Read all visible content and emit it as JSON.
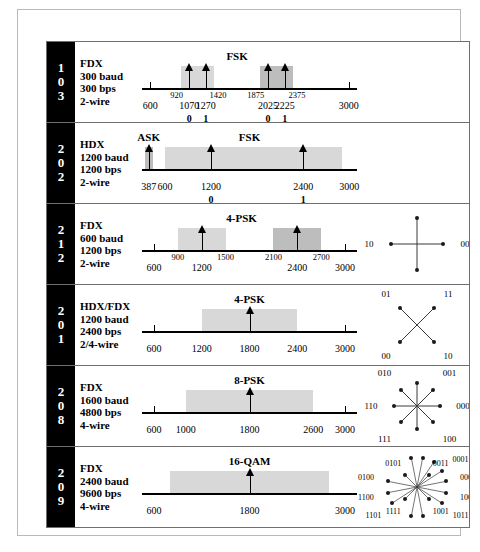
{
  "chart_data": {
    "type": "table",
    "columns": [
      "standard",
      "specs",
      "modulation",
      "spectrum",
      "constellation"
    ],
    "rows": [
      {
        "standard": "103",
        "standard_digits": [
          "1",
          "0",
          "3"
        ],
        "specs": [
          "FDX",
          "300 baud",
          "300 bps",
          "2-wire"
        ],
        "modulation": "FSK",
        "modulation_center_hz": 1650,
        "axis": {
          "min_hz": 500,
          "max_hz": 3100
        },
        "bands": [
          {
            "start_hz": 970,
            "end_hz": 1370,
            "shade": "light"
          },
          {
            "start_hz": 1925,
            "end_hz": 2325,
            "shade": "dark"
          }
        ],
        "carriers": [
          {
            "hz": 1070,
            "bit": "0"
          },
          {
            "hz": 1270,
            "bit": "1"
          },
          {
            "hz": 2025,
            "bit": "0"
          },
          {
            "hz": 2225,
            "bit": "1"
          }
        ],
        "edge_labels": [
          {
            "hz": 920,
            "text": "920"
          },
          {
            "hz": 1420,
            "text": "1420"
          },
          {
            "hz": 1875,
            "text": "1875"
          },
          {
            "hz": 2375,
            "text": "2375"
          }
        ],
        "axis_labels": [
          {
            "hz": 600,
            "text": "600",
            "tick": true
          },
          {
            "hz": 1070,
            "text": "1070",
            "tick": false
          },
          {
            "hz": 1270,
            "text": "1270",
            "tick": false
          },
          {
            "hz": 2025,
            "text": "2025",
            "tick": false
          },
          {
            "hz": 2225,
            "text": "2225",
            "tick": false
          },
          {
            "hz": 3000,
            "text": "3000",
            "tick": true
          }
        ],
        "constellation": null
      },
      {
        "standard": "202",
        "standard_digits": [
          "2",
          "0",
          "2"
        ],
        "specs": [
          "HDX",
          "1200 baud",
          "1200 bps",
          "2-wire"
        ],
        "modulation": "FSK",
        "modulation_center_hz": 1700,
        "secondary_modulation": "ASK",
        "secondary_modulation_center_hz": 387,
        "axis": {
          "min_hz": 300,
          "max_hz": 3100
        },
        "bands": [
          {
            "start_hz": 340,
            "end_hz": 440,
            "shade": "dark"
          },
          {
            "start_hz": 600,
            "end_hz": 2900,
            "shade": "light"
          }
        ],
        "carriers": [
          {
            "hz": 387,
            "bit": ""
          },
          {
            "hz": 1200,
            "bit": "0"
          },
          {
            "hz": 2400,
            "bit": "1"
          }
        ],
        "edge_labels": [],
        "axis_labels": [
          {
            "hz": 387,
            "text": "387",
            "tick": false
          },
          {
            "hz": 600,
            "text": "600",
            "tick": false
          },
          {
            "hz": 1200,
            "text": "1200",
            "tick": false
          },
          {
            "hz": 2400,
            "text": "2400",
            "tick": false
          },
          {
            "hz": 3000,
            "text": "3000",
            "tick": false
          }
        ],
        "constellation": null
      },
      {
        "standard": "212",
        "standard_digits": [
          "2",
          "1",
          "2"
        ],
        "specs": [
          "FDX",
          "600 baud",
          "1200 bps",
          "2-wire"
        ],
        "modulation": "4-PSK",
        "modulation_center_hz": 1700,
        "axis": {
          "min_hz": 450,
          "max_hz": 3150
        },
        "bands": [
          {
            "start_hz": 900,
            "end_hz": 1500,
            "shade": "light"
          },
          {
            "start_hz": 2100,
            "end_hz": 2700,
            "shade": "dark"
          }
        ],
        "carriers": [
          {
            "hz": 1200,
            "bit": ""
          },
          {
            "hz": 2400,
            "bit": ""
          }
        ],
        "edge_labels": [
          {
            "hz": 900,
            "text": "900"
          },
          {
            "hz": 1500,
            "text": "1500"
          },
          {
            "hz": 2100,
            "text": "2100"
          },
          {
            "hz": 2700,
            "text": "2700"
          }
        ],
        "axis_labels": [
          {
            "hz": 600,
            "text": "600",
            "tick": true
          },
          {
            "hz": 1200,
            "text": "1200",
            "tick": false
          },
          {
            "hz": 2400,
            "text": "2400",
            "tick": false
          },
          {
            "hz": 3000,
            "text": "3000",
            "tick": true
          }
        ],
        "constellation": {
          "type": "cross",
          "points": [
            {
              "label": "01",
              "angle_deg": 90
            },
            {
              "label": "00",
              "angle_deg": 0
            },
            {
              "label": "11",
              "angle_deg": 270
            },
            {
              "label": "10",
              "angle_deg": 180
            }
          ]
        }
      },
      {
        "standard": "201",
        "standard_digits": [
          "2",
          "0",
          "1"
        ],
        "specs": [
          "HDX/FDX",
          "1200 baud",
          "2400 bps",
          "2/4-wire"
        ],
        "modulation": "4-PSK",
        "modulation_center_hz": 1800,
        "axis": {
          "min_hz": 450,
          "max_hz": 3150
        },
        "bands": [
          {
            "start_hz": 1200,
            "end_hz": 2400,
            "shade": "light"
          }
        ],
        "carriers": [
          {
            "hz": 1800,
            "bit": ""
          }
        ],
        "edge_labels": [],
        "axis_labels": [
          {
            "hz": 600,
            "text": "600",
            "tick": true
          },
          {
            "hz": 1200,
            "text": "1200",
            "tick": false
          },
          {
            "hz": 1800,
            "text": "1800",
            "tick": false
          },
          {
            "hz": 2400,
            "text": "2400",
            "tick": false
          },
          {
            "hz": 3000,
            "text": "3000",
            "tick": true
          }
        ],
        "constellation": {
          "type": "x",
          "points": [
            {
              "label": "01",
              "angle_deg": 135
            },
            {
              "label": "11",
              "angle_deg": 45
            },
            {
              "label": "00",
              "angle_deg": 225
            },
            {
              "label": "10",
              "angle_deg": 315
            }
          ]
        }
      },
      {
        "standard": "208",
        "standard_digits": [
          "2",
          "0",
          "8"
        ],
        "specs": [
          "FDX",
          "1600 baud",
          "4800 bps",
          "4-wire"
        ],
        "modulation": "8-PSK",
        "modulation_center_hz": 1800,
        "axis": {
          "min_hz": 450,
          "max_hz": 3150
        },
        "bands": [
          {
            "start_hz": 1000,
            "end_hz": 2600,
            "shade": "light"
          }
        ],
        "carriers": [
          {
            "hz": 1800,
            "bit": ""
          }
        ],
        "edge_labels": [],
        "axis_labels": [
          {
            "hz": 600,
            "text": "600",
            "tick": true
          },
          {
            "hz": 1000,
            "text": "1000",
            "tick": false
          },
          {
            "hz": 1800,
            "text": "1800",
            "tick": false
          },
          {
            "hz": 2600,
            "text": "2600",
            "tick": false
          },
          {
            "hz": 3000,
            "text": "3000",
            "tick": true
          }
        ],
        "constellation": {
          "type": "star8",
          "points": [
            {
              "label": "000",
              "angle_deg": 0
            },
            {
              "label": "001",
              "angle_deg": 45
            },
            {
              "label": "011",
              "angle_deg": 90
            },
            {
              "label": "010",
              "angle_deg": 135
            },
            {
              "label": "110",
              "angle_deg": 180
            },
            {
              "label": "111",
              "angle_deg": 225
            },
            {
              "label": "101",
              "angle_deg": 270
            },
            {
              "label": "100",
              "angle_deg": 315
            }
          ]
        }
      },
      {
        "standard": "209",
        "standard_digits": [
          "2",
          "0",
          "9"
        ],
        "specs": [
          "FDX",
          "2400  baud",
          "9600 bps",
          "4-wire"
        ],
        "modulation": "16-QAM",
        "modulation_center_hz": 1800,
        "axis": {
          "min_hz": 450,
          "max_hz": 3150
        },
        "bands": [
          {
            "start_hz": 800,
            "end_hz": 2800,
            "shade": "light"
          }
        ],
        "carriers": [
          {
            "hz": 1800,
            "bit": ""
          }
        ],
        "edge_labels": [],
        "axis_labels": [
          {
            "hz": 600,
            "text": "600",
            "tick": false
          },
          {
            "hz": 1800,
            "text": "1800",
            "tick": false
          },
          {
            "hz": 3000,
            "text": "3000",
            "tick": false
          }
        ],
        "constellation": {
          "type": "star16",
          "points": [
            {
              "label": "0000",
              "angle_deg": 11,
              "radius": 1.0
            },
            {
              "label": "0001",
              "angle_deg": 33,
              "radius": 1.0
            },
            {
              "label": "0010",
              "angle_deg": 56,
              "radius": 1.0
            },
            {
              "label": "0110",
              "angle_deg": 79,
              "radius": 1.0
            },
            {
              "label": "0111",
              "angle_deg": 101,
              "radius": 1.0
            },
            {
              "label": "0100",
              "angle_deg": 169,
              "radius": 1.0
            },
            {
              "label": "1100",
              "angle_deg": 191,
              "radius": 1.0
            },
            {
              "label": "1101",
              "angle_deg": 213,
              "radius": 1.0
            },
            {
              "label": "1110",
              "angle_deg": 259,
              "radius": 1.0
            },
            {
              "label": "1010",
              "angle_deg": 281,
              "radius": 1.0
            },
            {
              "label": "1011",
              "angle_deg": 327,
              "radius": 1.0
            },
            {
              "label": "1000",
              "angle_deg": 349,
              "radius": 1.0
            },
            {
              "label": "0011",
              "angle_deg": 45,
              "radius": 0.55
            },
            {
              "label": "0101",
              "angle_deg": 135,
              "radius": 0.55
            },
            {
              "label": "1111",
              "angle_deg": 225,
              "radius": 0.55
            },
            {
              "label": "1001",
              "angle_deg": 315,
              "radius": 0.55
            }
          ]
        }
      }
    ]
  }
}
